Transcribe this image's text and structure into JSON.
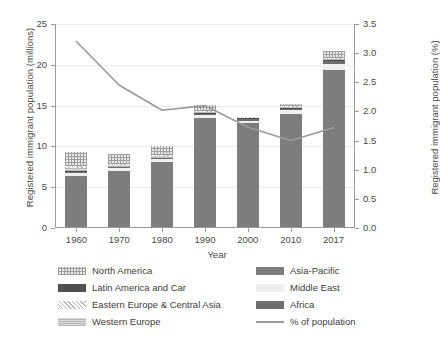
{
  "chart_data": {
    "type": "bar",
    "subtype": "stacked-bar-with-line",
    "title": "",
    "xlabel": "Year",
    "ylabel": "Registered immigrant population (millions)",
    "ylabel_secondary": "Registered immigrant population (%)",
    "categories": [
      "1960",
      "1970",
      "1980",
      "1990",
      "2000",
      "2010",
      "2017"
    ],
    "ylim": [
      0,
      25
    ],
    "yticks": [
      "0",
      "5",
      "10",
      "15",
      "20",
      "25"
    ],
    "ylim_secondary": [
      0,
      3.5
    ],
    "yticks_secondary": [
      "0.0",
      "0.5",
      "1.0",
      "1.5",
      "2.0",
      "2.5",
      "3.0",
      "3.5"
    ],
    "grid": true,
    "legend_position": "bottom",
    "series": [
      {
        "name": "Asia-Pacific",
        "key": "asia",
        "values": [
          6.3,
          6.9,
          8.0,
          13.3,
          12.7,
          13.8,
          19.3
        ]
      },
      {
        "name": "Middle East",
        "key": "me",
        "values": [
          0.35,
          0.3,
          0.3,
          0.4,
          0.35,
          0.5,
          0.7
        ]
      },
      {
        "name": "Africa",
        "key": "africa",
        "values": [
          0.1,
          0.1,
          0.1,
          0.15,
          0.15,
          0.2,
          0.3
        ]
      },
      {
        "name": "Latin America and Car",
        "key": "latin",
        "values": [
          0.1,
          0.1,
          0.1,
          0.1,
          0.1,
          0.1,
          0.15
        ]
      },
      {
        "name": "Western Europe",
        "key": "weurope",
        "values": [
          0.35,
          0.2,
          0.2,
          0.2,
          0.1,
          0.1,
          0.15
        ]
      },
      {
        "name": "Eastern Europe & Central Asia",
        "key": "eeurope",
        "values": [
          0.3,
          0.1,
          0.1,
          0.1,
          0.1,
          0.1,
          0.1
        ]
      },
      {
        "name": "North America",
        "key": "na",
        "values": [
          1.7,
          1.2,
          1.1,
          0.75,
          0.0,
          0.3,
          0.9
        ]
      }
    ],
    "totals": [
      9.2,
      8.9,
      9.9,
      15.0,
      13.5,
      15.1,
      21.6
    ],
    "line_series": {
      "name": "% of population",
      "axis": "secondary",
      "values": [
        3.2,
        2.45,
        2.02,
        2.1,
        1.73,
        1.5,
        1.72
      ],
      "color": "#9a9a9a"
    },
    "colors": {
      "asia": "#7d7d7d",
      "me": "#efefef",
      "africa": "#6e6e6e",
      "latin": "#4f4f4f",
      "weurope": "#c4c4c4",
      "eeurope": "#dcdcdc",
      "na": "#e0e0e0",
      "line": "#9a9a9a",
      "axis": "#9a9a9a",
      "grid": "#ececec",
      "text": "#3d3d3d"
    }
  },
  "legend": {
    "rows": [
      {
        "left": "North America",
        "left_key": "na",
        "right": "Asia-Pacific",
        "right_key": "asia"
      },
      {
        "left": "Latin America and Car",
        "left_key": "latin",
        "right": "Middle East",
        "right_key": "me"
      },
      {
        "left": "Eastern Europe & Central Asia",
        "left_key": "eeurope",
        "right": "Africa",
        "right_key": "africa"
      },
      {
        "left": "Western Europe",
        "left_key": "weurope",
        "right": "% of population",
        "right_key": "line"
      }
    ]
  }
}
